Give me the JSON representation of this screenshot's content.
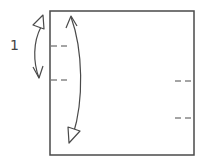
{
  "diagram": {
    "type": "origami-fold-diagram",
    "step_label": "1",
    "colors": {
      "stroke": "#4a4a4a",
      "background": "#ffffff"
    },
    "square": {
      "x": 50,
      "y": 11,
      "width": 144,
      "height": 144
    },
    "left_crease_marks": [
      {
        "y": 46,
        "x1": 51,
        "x2": 68
      },
      {
        "y": 80,
        "x1": 51,
        "x2": 68
      }
    ],
    "right_crease_marks": [
      {
        "y": 81,
        "x1": 176,
        "x2": 193
      },
      {
        "y": 118,
        "x1": 176,
        "x2": 193
      }
    ],
    "arrows": [
      {
        "name": "short-fold-arrow",
        "description": "Double-headed curved arrow beside step label"
      },
      {
        "name": "long-fold-arrow",
        "description": "Long double-headed curved arrow inside square"
      }
    ]
  }
}
